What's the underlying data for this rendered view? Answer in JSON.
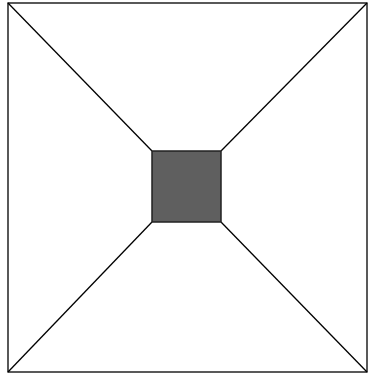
{
  "diagram": {
    "type": "geometric-figure",
    "outer_square": {
      "x1": 8,
      "y1": 3,
      "x2": 367,
      "y2": 372,
      "stroke": "#000000",
      "fill": "#ffffff"
    },
    "inner_square": {
      "x1": 152,
      "y1": 151,
      "x2": 221,
      "y2": 222,
      "stroke": "#222222",
      "fill": "#5f5f5f"
    },
    "connectors": [
      {
        "from": "outer-top-left",
        "to": "inner-top-left"
      },
      {
        "from": "outer-top-right",
        "to": "inner-top-right"
      },
      {
        "from": "outer-bottom-left",
        "to": "inner-bottom-left"
      },
      {
        "from": "outer-bottom-right",
        "to": "inner-bottom-right"
      }
    ],
    "line_color": "#000000"
  }
}
